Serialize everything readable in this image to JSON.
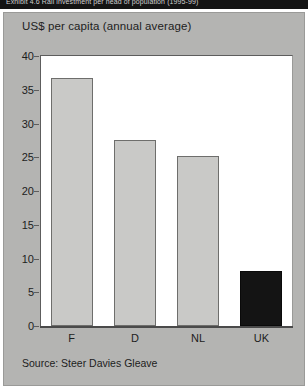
{
  "banner": {
    "text": "Exhibit 4.6 Rail investment per head of population (1995-99)"
  },
  "chart_data": {
    "type": "bar",
    "title": "US$ per capita (annual average)",
    "xlabel": "",
    "ylabel": "",
    "categories": [
      "F",
      "D",
      "NL",
      "UK"
    ],
    "values": [
      36.8,
      27.6,
      25.2,
      8.1
    ],
    "ylim": [
      0,
      40
    ],
    "yticks": [
      "0",
      "5",
      "10",
      "15",
      "20",
      "25",
      "30",
      "35",
      "40"
    ],
    "grid": false,
    "legend": "none",
    "bar_colors": [
      "#c9c9c7",
      "#c9c9c7",
      "#c9c9c7",
      "#141414"
    ],
    "source": "Source: Steer Davies Gleave"
  },
  "colors": {
    "panel": "#b4b4b2",
    "plot_background": "#ffffff",
    "bar_light": "#c9c9c7",
    "bar_dark": "#141414",
    "axis": "#4a4a4a",
    "text": "#1d1d1d"
  }
}
